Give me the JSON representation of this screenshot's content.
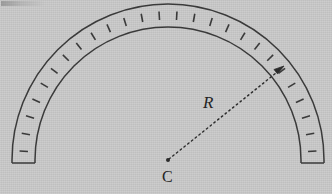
{
  "figure": {
    "type": "geometry-diagram",
    "background_color": "#c9c9c9",
    "ink_color": "#3a3a3a",
    "labels": {
      "radius": "R",
      "center": "C"
    },
    "center_point": {
      "x": 168,
      "y": 160
    },
    "arc": {
      "outer_radius": 156,
      "inner_radius": 133,
      "start_angle_deg": 180,
      "end_angle_deg": 360,
      "leg_bottom_y": 163,
      "hatch_count": 26
    },
    "radius_arrow": {
      "from": {
        "x": 168,
        "y": 160
      },
      "to": {
        "x": 284,
        "y": 66
      },
      "style": "dashed",
      "arrowhead": "end"
    },
    "annotations": [
      "R",
      "C"
    ]
  }
}
